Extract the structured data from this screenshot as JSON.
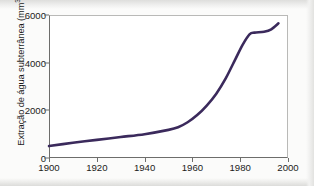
{
  "chart_data": {
    "type": "line",
    "title": "",
    "subtitle": "",
    "xlabel": "",
    "ylabel": "Extração de água subterrânea (mm³/ano)",
    "ylabel_parts": {
      "prefix": "Extração de água subterrânea (mm",
      "superscript": "3",
      "suffix": "/ano)"
    },
    "xlim": [
      1900,
      2000
    ],
    "ylim": [
      0,
      6000
    ],
    "xticks": [
      "1900",
      "1920",
      "1940",
      "1960",
      "1980",
      "2000"
    ],
    "xtick_values": [
      1900,
      1920,
      1940,
      1960,
      1980,
      2000
    ],
    "yticks": [
      "0",
      "2000",
      "4000",
      "6000"
    ],
    "ytick_values": [
      0,
      2000,
      4000,
      6000
    ],
    "grid": false,
    "legend": null,
    "legend_position": "none",
    "series": [
      {
        "name": "Extração de água subterrânea",
        "color": "#3b2a5c",
        "x": [
          1900,
          1910,
          1920,
          1930,
          1940,
          1950,
          1954,
          1958,
          1962,
          1966,
          1970,
          1974,
          1978,
          1981,
          1984,
          1986,
          1990,
          1993,
          1996
        ],
        "values": [
          500,
          640,
          760,
          880,
          1000,
          1180,
          1290,
          1500,
          1800,
          2200,
          2700,
          3350,
          4150,
          4750,
          5200,
          5260,
          5300,
          5400,
          5650
        ]
      }
    ]
  },
  "axis": {
    "line_color": "#6d6d6b",
    "frame_color": "#b9b9b7",
    "text_color": "#1b1b1b",
    "plot_background": "#ffffff"
  },
  "page": {
    "background": "#fbfbfa"
  }
}
